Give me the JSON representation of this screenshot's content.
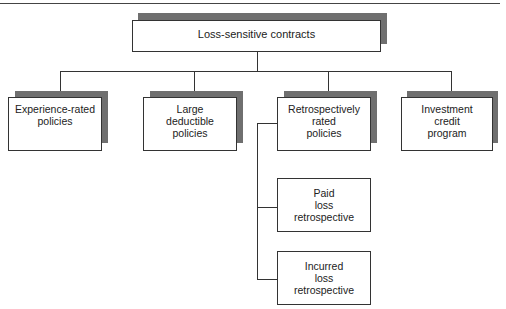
{
  "diagram": {
    "root": {
      "label": "Loss-sensitive contracts"
    },
    "children": [
      {
        "label": "Experience-rated\npolicies"
      },
      {
        "label": "Large\ndeductible\npolicies"
      },
      {
        "label": "Retrospectively\nrated\npolicies"
      },
      {
        "label": "Investment\ncredit\nprogram"
      }
    ],
    "retro_children": [
      {
        "label": "Paid\nloss\nretrospective"
      },
      {
        "label": "Incurred\nloss\nretrospective"
      }
    ]
  }
}
